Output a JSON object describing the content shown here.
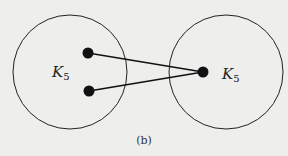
{
  "figure": {
    "caption": "(b)",
    "colors": {
      "background": "#eeeeec",
      "stroke": "#222222",
      "node": "#111111"
    },
    "clusters": [
      {
        "id": "left",
        "label_main": "K",
        "label_sub": "5",
        "cx": 70,
        "cy": 72,
        "r": 57,
        "nodes": [
          {
            "x": 88,
            "y": 53
          },
          {
            "x": 89,
            "y": 91
          }
        ]
      },
      {
        "id": "right",
        "label_main": "K",
        "label_sub": "5",
        "cx": 226,
        "cy": 72,
        "r": 57,
        "nodes": [
          {
            "x": 203,
            "y": 72
          }
        ]
      }
    ],
    "edges": [
      {
        "from": [
          88,
          53
        ],
        "to": [
          203,
          72
        ]
      },
      {
        "from": [
          89,
          91
        ],
        "to": [
          203,
          72
        ]
      }
    ]
  }
}
